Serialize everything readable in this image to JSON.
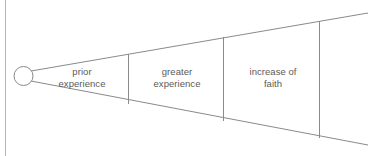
{
  "diagram": {
    "type": "cone-progression",
    "title_text": "",
    "stroke_color": "#8a8a8a",
    "label_color": "#5a5a5a",
    "background_color": "#ffffff",
    "border": {
      "name": "left-border-line",
      "x": 5,
      "y_top": 0,
      "y_bottom": 156,
      "color": "#b4b4b4"
    },
    "apex_circle": {
      "name": "apex-circle",
      "cx": 23.5,
      "cy": 76,
      "r": 9.5,
      "fill": "#ffffff"
    },
    "cone": {
      "top_line": {
        "x1": 31,
        "y1": 71,
        "x2": 368,
        "y2": 13
      },
      "bottom_line": {
        "x1": 31,
        "y1": 81,
        "x2": 368,
        "y2": 145
      }
    },
    "dividers": [
      {
        "name": "divider-1",
        "x": 128,
        "y_top": 54,
        "y_bottom": 104
      },
      {
        "name": "divider-2",
        "x": 223,
        "y_top": 37,
        "y_bottom": 121
      },
      {
        "name": "divider-3",
        "x": 319,
        "y_top": 21,
        "y_bottom": 138
      }
    ],
    "segments": [
      {
        "label": "prior\nexperience",
        "line1": "prior",
        "line2": "experience"
      },
      {
        "label": "greater\nexperience",
        "line1": "greater",
        "line2": "experience"
      },
      {
        "label": "increase of\nfaith",
        "line1": "increase of",
        "line2": "faith"
      }
    ]
  }
}
